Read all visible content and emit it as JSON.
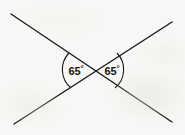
{
  "figure": {
    "background_color": "#f7f7f5",
    "ink_color": "#1a1a1a",
    "intersection": {
      "x": 93,
      "y": 70
    },
    "lines": [
      {
        "name": "line-top-left-to-bottom-right",
        "x1": 11,
        "y1": 14,
        "x2": 172,
        "y2": 122
      },
      {
        "name": "line-bottom-left-to-top-right",
        "x1": 14,
        "y1": 124,
        "x2": 172,
        "y2": 22
      }
    ],
    "angles": [
      {
        "name": "left-vertical-angle",
        "value": "65",
        "degree_symbol": "°",
        "label_x": 76,
        "label_y": 71,
        "arc": {
          "start_x": 69,
          "start_y": 53,
          "end_x": 71,
          "end_y": 88,
          "radius_x": 24,
          "radius_y": 24,
          "sweep": 0
        }
      },
      {
        "name": "right-vertical-angle",
        "value": "65",
        "degree_symbol": "°",
        "label_x": 112,
        "label_y": 71,
        "arc": {
          "start_x": 117,
          "start_y": 53,
          "end_x": 115,
          "end_y": 88,
          "radius_x": 24,
          "radius_y": 24,
          "sweep": 1
        }
      }
    ]
  }
}
